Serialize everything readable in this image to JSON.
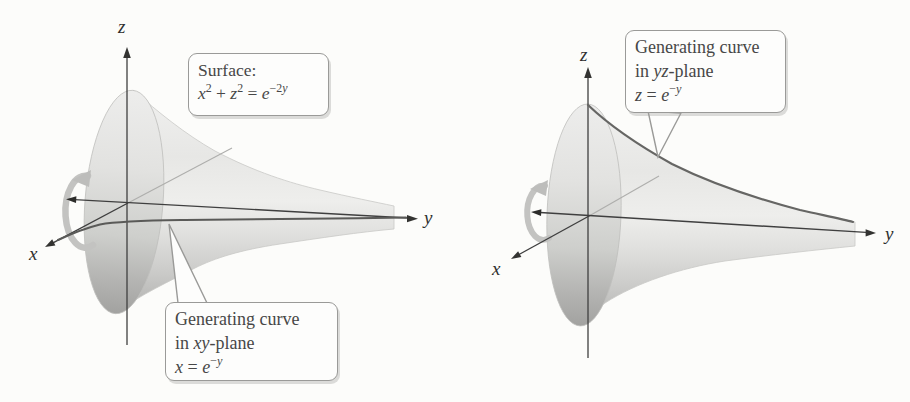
{
  "colors": {
    "background": "#fcfcfa",
    "axis_line": "#3f3f3f",
    "curve_line": "#5a5a5a",
    "surface_light": "#efefee",
    "surface_dark": "#a3a3a1",
    "callout_border": "#9a9a98",
    "callout_background": "#fdfdfc",
    "rotation_arrow": "#c3c3c1",
    "text": "#474747"
  },
  "left_panel": {
    "axes": {
      "x": "x",
      "y": "y",
      "z": "z"
    },
    "surface_box": {
      "title": "Surface:",
      "formula": {
        "var1": "x",
        "sup1": "2",
        "plus": " + ",
        "var2": "z",
        "sup2": "2",
        "eq": " = ",
        "base": "e",
        "exp_coef": "−2",
        "exp_var": "y"
      }
    },
    "curve_box": {
      "line1": "Generating curve",
      "line2_prefix": "in ",
      "line2_plane": "xy",
      "line2_suffix": "-plane",
      "formula": {
        "lhs": "x",
        "eq": " = ",
        "base": "e",
        "exp_coef": "−",
        "exp_var": "y"
      }
    }
  },
  "right_panel": {
    "axes": {
      "x": "x",
      "y": "y",
      "z": "z"
    },
    "curve_box": {
      "line1": "Generating curve",
      "line2_prefix": "in ",
      "line2_plane": "yz",
      "line2_suffix": "-plane",
      "formula": {
        "lhs": "z",
        "eq": " = ",
        "base": "e",
        "exp_coef": "−",
        "exp_var": "y"
      }
    }
  }
}
